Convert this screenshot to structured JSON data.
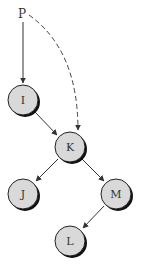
{
  "diagram": {
    "type": "binary-tree-pointer",
    "colors": {
      "node_fill": "#d9d9d9",
      "node_stroke": "#222222",
      "shadow": "#111111",
      "edge": "#333333",
      "dashed_edge": "#444444"
    },
    "pointer": {
      "id": "P",
      "label": "P",
      "x": 23,
      "y": 14
    },
    "nodes": [
      {
        "id": "I",
        "label": "I",
        "x": 23,
        "y": 100
      },
      {
        "id": "K",
        "label": "K",
        "x": 70,
        "y": 147
      },
      {
        "id": "J",
        "label": "J",
        "x": 23,
        "y": 194
      },
      {
        "id": "M",
        "label": "M",
        "x": 116,
        "y": 194
      },
      {
        "id": "L",
        "label": "L",
        "x": 70,
        "y": 241
      }
    ],
    "edges": [
      {
        "from": "P",
        "to": "I",
        "style": "solid"
      },
      {
        "from": "P",
        "to": "K",
        "style": "dashed"
      },
      {
        "from": "I",
        "to": "K",
        "style": "solid"
      },
      {
        "from": "K",
        "to": "J",
        "style": "solid"
      },
      {
        "from": "K",
        "to": "M",
        "style": "solid"
      },
      {
        "from": "M",
        "to": "L",
        "style": "solid"
      }
    ]
  }
}
